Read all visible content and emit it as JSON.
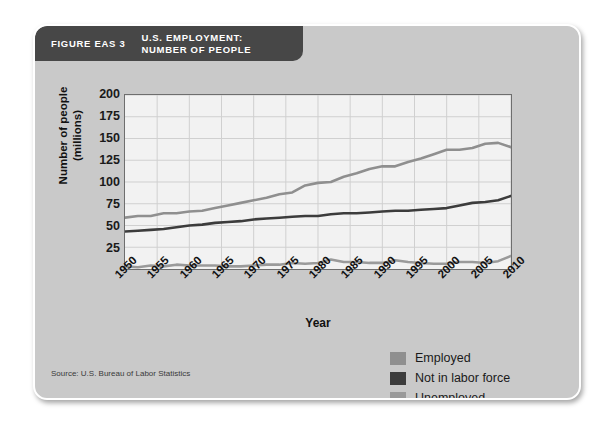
{
  "figure": {
    "number_label": "FIGURE EAS 3",
    "title": "U.S. EMPLOYMENT:\nNUMBER OF PEOPLE",
    "source": "Source: U.S. Bureau of Labor Statistics",
    "banner_color": "#474747",
    "frame_color": "#c9c9c9",
    "plot_background": "#f2f2f2",
    "gridline_color": "#cfcfcf",
    "axis_color": "#6e6e6e"
  },
  "chart_data": {
    "type": "line",
    "title": "U.S. EMPLOYMENT: NUMBER OF PEOPLE",
    "xlabel": "Year",
    "ylabel": "Number of people\n(millions)",
    "xlim": [
      1950,
      2010
    ],
    "ylim": [
      0,
      200
    ],
    "yticks": [
      25,
      50,
      75,
      100,
      125,
      150,
      175,
      200
    ],
    "xticks": [
      1950,
      1955,
      1960,
      1965,
      1970,
      1975,
      1980,
      1985,
      1990,
      1995,
      2000,
      2005,
      2010
    ],
    "grid": true,
    "legend_position": "bottom-right",
    "x": [
      1950,
      1952,
      1954,
      1956,
      1958,
      1960,
      1962,
      1964,
      1966,
      1968,
      1970,
      1972,
      1974,
      1976,
      1978,
      1980,
      1982,
      1984,
      1986,
      1988,
      1990,
      1992,
      1994,
      1996,
      1998,
      2000,
      2002,
      2004,
      2006,
      2008,
      2010
    ],
    "series": [
      {
        "name": "Employed",
        "color": "#8f8f8f",
        "values": [
          59,
          61,
          61,
          64,
          64,
          66,
          67,
          70,
          73,
          76,
          79,
          82,
          86,
          88,
          96,
          99,
          100,
          106,
          110,
          115,
          118,
          118,
          123,
          127,
          132,
          137,
          137,
          139,
          144,
          145,
          140
        ]
      },
      {
        "name": "Not in labor force",
        "color": "#3c3c3c",
        "values": [
          43,
          44,
          45,
          46,
          48,
          50,
          51,
          53,
          54,
          55,
          57,
          58,
          59,
          60,
          61,
          61,
          63,
          64,
          64,
          65,
          66,
          67,
          67,
          68,
          69,
          70,
          73,
          76,
          77,
          79,
          84
        ]
      },
      {
        "name": "Unemployed",
        "color": "#9a9a9a",
        "values": [
          3,
          2,
          4,
          3,
          5,
          4,
          4,
          4,
          3,
          3,
          4,
          5,
          5,
          7,
          6,
          7,
          11,
          8,
          8,
          7,
          7,
          10,
          8,
          7,
          6,
          6,
          8,
          8,
          7,
          9,
          15
        ]
      }
    ]
  },
  "legend": {
    "items": [
      {
        "label": "Employed",
        "color": "#8f8f8f"
      },
      {
        "label": "Not in labor force",
        "color": "#3c3c3c"
      },
      {
        "label": "Unemployed",
        "color": "#9a9a9a"
      }
    ]
  }
}
